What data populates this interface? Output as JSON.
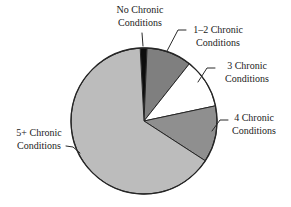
{
  "chart_data": {
    "type": "pie",
    "title": "",
    "legend": "none",
    "labels_style": "outside labels with leader lines",
    "categories": [
      "No Chronic Conditions",
      "1–2 Chronic Conditions",
      "3 Chronic Conditions",
      "4 Chronic Conditions",
      "5+ Chronic Conditions"
    ],
    "values": [
      1.5,
      10,
      11,
      12.5,
      65
    ],
    "values_note": "percent of whole, estimated from slice angles (no numeric data labels shown)",
    "slices": [
      {
        "id": "no-chronic",
        "label_line1": "No Chronic",
        "label_line2": "Conditions",
        "value": 1.5,
        "color": "#0d0d0d"
      },
      {
        "id": "1-2-chronic",
        "label_line1": "1–2 Chronic",
        "label_line2": "Conditions",
        "value": 10,
        "color": "#7f7f7f"
      },
      {
        "id": "3-chronic",
        "label_line1": "3 Chronic",
        "label_line2": "Conditions",
        "value": 11,
        "color": "#ffffff"
      },
      {
        "id": "4-chronic",
        "label_line1": "4 Chronic",
        "label_line2": "Conditions",
        "value": 12.5,
        "color": "#8f8f8f"
      },
      {
        "id": "5-plus-chronic",
        "label_line1": "5+ Chronic",
        "label_line2": "Conditions",
        "value": 65,
        "color": "#bcbcbc"
      }
    ],
    "layout": {
      "cx": 144,
      "cy": 121,
      "r": 73,
      "start_angle_deg": -3,
      "outline_color": "#262626",
      "leader_line_color": "#2a2a2a",
      "background": "#ffffff"
    }
  }
}
